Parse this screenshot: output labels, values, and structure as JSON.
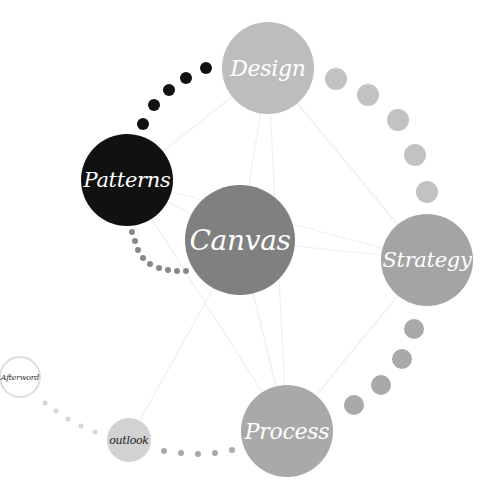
{
  "diagram": {
    "type": "concept-network",
    "nodes": [
      {
        "id": "design",
        "label": "Design",
        "cx": 268,
        "cy": 68,
        "r": 46,
        "fill": "#bdbdbd",
        "text_color": "#ffffff",
        "font_size": 22
      },
      {
        "id": "patterns",
        "label": "Patterns",
        "cx": 127,
        "cy": 180,
        "r": 46,
        "fill": "#111111",
        "text_color": "#ffffff",
        "font_size": 21
      },
      {
        "id": "canvas",
        "label": "Canvas",
        "cx": 240,
        "cy": 240,
        "r": 55,
        "fill": "#808080",
        "text_color": "#ffffff",
        "font_size": 28
      },
      {
        "id": "strategy",
        "label": "Strategy",
        "cx": 427,
        "cy": 260,
        "r": 46,
        "fill": "#a4a4a4",
        "text_color": "#ffffff",
        "font_size": 21
      },
      {
        "id": "process",
        "label": "Process",
        "cx": 287,
        "cy": 431,
        "r": 46,
        "fill": "#a9a9a9",
        "text_color": "#ffffff",
        "font_size": 22
      },
      {
        "id": "outlook",
        "label": "outlook",
        "cx": 129,
        "cy": 440,
        "r": 22,
        "fill": "#d2d2d2",
        "text_color": "#222222",
        "font_size": 11
      },
      {
        "id": "afterword",
        "label": "Afterword",
        "cx": 20,
        "cy": 377,
        "r": 21,
        "fill": "#ffffff",
        "text_color": "#333333",
        "font_size": 8,
        "stroke": "#dddddd"
      }
    ],
    "edges": [
      [
        "design",
        "patterns"
      ],
      [
        "design",
        "canvas"
      ],
      [
        "design",
        "process"
      ],
      [
        "design",
        "strategy"
      ],
      [
        "patterns",
        "canvas"
      ],
      [
        "patterns",
        "strategy"
      ],
      [
        "patterns",
        "process"
      ],
      [
        "canvas",
        "strategy"
      ],
      [
        "canvas",
        "process"
      ],
      [
        "canvas",
        "outlook"
      ],
      [
        "strategy",
        "process"
      ]
    ],
    "edge_color": "#efefef",
    "dot_paths": [
      {
        "name": "patterns-to-design",
        "color": "#111111",
        "dots": [
          [
            143,
            124,
            6
          ],
          [
            154,
            105,
            6
          ],
          [
            169,
            90,
            6
          ],
          [
            186,
            78,
            6
          ],
          [
            206,
            68,
            6
          ]
        ]
      },
      {
        "name": "design-to-strategy",
        "color": "#c2c2c2",
        "dots": [
          [
            336,
            79,
            11
          ],
          [
            368,
            95,
            11
          ],
          [
            398,
            120,
            11
          ],
          [
            415,
            155,
            11
          ],
          [
            427,
            192,
            11
          ]
        ]
      },
      {
        "name": "strategy-to-process",
        "color": "#a9a9a9",
        "dots": [
          [
            414,
            329,
            10
          ],
          [
            402,
            359,
            10
          ],
          [
            381,
            385,
            10
          ],
          [
            354,
            405,
            10
          ]
        ]
      },
      {
        "name": "patterns-to-canvas",
        "color": "#888888",
        "dots": [
          [
            132,
            232,
            3
          ],
          [
            135,
            241,
            3
          ],
          [
            138,
            250,
            3
          ],
          [
            143,
            258,
            3
          ],
          [
            150,
            264,
            3
          ],
          [
            159,
            268,
            3
          ],
          [
            168,
            270,
            3
          ],
          [
            177,
            271,
            3
          ],
          [
            186,
            271,
            3
          ]
        ]
      },
      {
        "name": "outlook-to-process",
        "color": "#a9a9a9",
        "dots": [
          [
            164,
            451,
            3
          ],
          [
            181,
            453,
            3
          ],
          [
            198,
            454,
            3
          ],
          [
            215,
            453,
            3
          ],
          [
            232,
            450,
            3
          ]
        ]
      },
      {
        "name": "afterword-to-outlook",
        "color": "#d6d6d6",
        "dots": [
          [
            45,
            403,
            2.5
          ],
          [
            56,
            411,
            2.5
          ],
          [
            68,
            419,
            2.5
          ],
          [
            81,
            426,
            2.5
          ],
          [
            95,
            432,
            2.5
          ]
        ]
      }
    ]
  }
}
